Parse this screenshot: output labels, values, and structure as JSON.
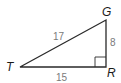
{
  "diagram": {
    "type": "right-triangle",
    "vertices": {
      "T": {
        "label": "T"
      },
      "G": {
        "label": "G"
      },
      "R": {
        "label": "R"
      }
    },
    "sides": {
      "TG": "17",
      "GR": "8",
      "TR": "15"
    },
    "right_angle_at": "R",
    "colors": {
      "stroke": "#2a2a2a",
      "vertex_label": "#1a1a1a",
      "side_label": "#7a7a7a"
    }
  }
}
